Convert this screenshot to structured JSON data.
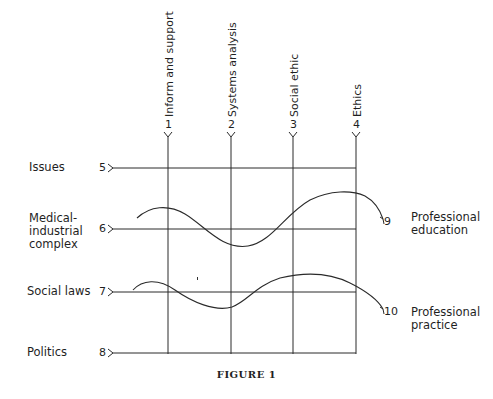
{
  "figure": {
    "caption": "FIGURE 1",
    "columns": [
      {
        "number": "1",
        "label": "Inform and support"
      },
      {
        "number": "2",
        "label": "Systems analysis"
      },
      {
        "number": "3",
        "label": "Social ethic"
      },
      {
        "number": "4",
        "label": "Ethics"
      }
    ],
    "rows": [
      {
        "number": "5",
        "label": "Issues"
      },
      {
        "number": "6",
        "label_lines": [
          "Medical-",
          "industrial",
          "complex"
        ]
      },
      {
        "number": "7",
        "label": "Social laws"
      },
      {
        "number": "8",
        "label": "Politics"
      }
    ],
    "curves": [
      {
        "number": "9",
        "label_lines": [
          "Professional",
          "education"
        ]
      },
      {
        "number": "10",
        "label_lines": [
          "Professional",
          "practice"
        ]
      }
    ]
  }
}
